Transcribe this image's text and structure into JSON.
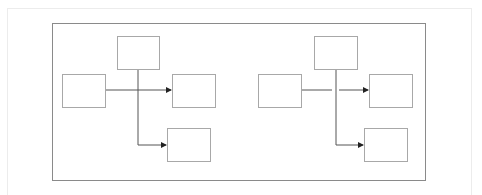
{
  "canvas": {
    "width": 482,
    "height": 195,
    "background": "#ffffff"
  },
  "colors": {
    "outer_frame": "#ececec",
    "inner_frame": "#8a8a8a",
    "box_stroke": "#a8a8a8",
    "connector": "#555555",
    "arrowhead": "#222222"
  },
  "diagrams": [
    {
      "id": "left",
      "crossing_style": "plain-cross",
      "boxes": [
        {
          "name": "top",
          "x": 117,
          "y": 36,
          "w": 42,
          "h": 33,
          "label": ""
        },
        {
          "name": "left",
          "x": 62,
          "y": 74,
          "w": 43,
          "h": 33,
          "label": ""
        },
        {
          "name": "right",
          "x": 172,
          "y": 74,
          "w": 43,
          "h": 33,
          "label": ""
        },
        {
          "name": "bottom",
          "x": 167,
          "y": 128,
          "w": 43,
          "h": 33,
          "label": ""
        }
      ],
      "connectors": [
        {
          "from": "left",
          "to": "right",
          "path": "M105 90 H171"
        },
        {
          "from": "top",
          "to": "bottom",
          "path": "M138 69 V145 H166"
        }
      ]
    },
    {
      "id": "right",
      "crossing_style": "line-gap",
      "boxes": [
        {
          "name": "top",
          "x": 314,
          "y": 36,
          "w": 43,
          "h": 33,
          "label": ""
        },
        {
          "name": "left",
          "x": 258,
          "y": 74,
          "w": 43,
          "h": 33,
          "label": ""
        },
        {
          "name": "right",
          "x": 369,
          "y": 74,
          "w": 43,
          "h": 33,
          "label": ""
        },
        {
          "name": "bottom",
          "x": 364,
          "y": 128,
          "w": 43,
          "h": 33,
          "label": ""
        }
      ],
      "connectors": [
        {
          "from": "left",
          "to": "right",
          "path": "M301 90 H332 M339 90 H368"
        },
        {
          "from": "top",
          "to": "bottom",
          "path": "M336 69 V145 H363"
        }
      ]
    }
  ]
}
